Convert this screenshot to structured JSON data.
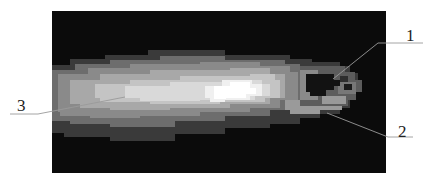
{
  "figure": {
    "background": "#0b0b0b",
    "panel": {
      "x": 52,
      "y": 11,
      "width": 334,
      "height": 162
    },
    "callouts": [
      {
        "id": "1",
        "label": "1",
        "text_x": 406,
        "text_y": 27,
        "line": [
          [
            333,
            79
          ],
          [
            378,
            43
          ],
          [
            423,
            43
          ]
        ]
      },
      {
        "id": "2",
        "label": "2",
        "text_x": 398,
        "text_y": 123,
        "line": [
          [
            327,
            113
          ],
          [
            388,
            137
          ],
          [
            413,
            137
          ]
        ]
      },
      {
        "id": "3",
        "label": "3",
        "text_x": 17,
        "text_y": 97,
        "line": [
          [
            125,
            97
          ],
          [
            38,
            114
          ],
          [
            10,
            114
          ]
        ]
      }
    ]
  }
}
